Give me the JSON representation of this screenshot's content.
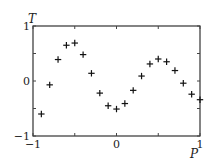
{
  "chart_data": {
    "type": "scatter",
    "title": "",
    "xlabel": "P",
    "ylabel": "T",
    "xlim": [
      -1,
      1
    ],
    "ylim": [
      -1,
      1
    ],
    "grid": false,
    "legend": null,
    "marker": "plus",
    "x_ticks": [
      -1,
      0,
      1
    ],
    "x_tick_labels": [
      "−1",
      "0",
      "1"
    ],
    "y_ticks": [
      -1,
      0,
      1
    ],
    "y_tick_labels": [
      "−1",
      "0",
      "1"
    ],
    "minor_ticks": [
      -0.5,
      0.5
    ],
    "series": [
      {
        "name": "T(P)",
        "x": [
          -0.9,
          -0.8,
          -0.7,
          -0.6,
          -0.5,
          -0.4,
          -0.3,
          -0.2,
          -0.1,
          0.0,
          0.1,
          0.2,
          0.3,
          0.4,
          0.5,
          0.6,
          0.7,
          0.8,
          0.9,
          1.0
        ],
        "y": [
          -0.6,
          -0.07,
          0.39,
          0.65,
          0.69,
          0.48,
          0.14,
          -0.22,
          -0.45,
          -0.51,
          -0.41,
          -0.17,
          0.09,
          0.31,
          0.4,
          0.35,
          0.19,
          -0.04,
          -0.24,
          -0.34
        ]
      }
    ]
  }
}
